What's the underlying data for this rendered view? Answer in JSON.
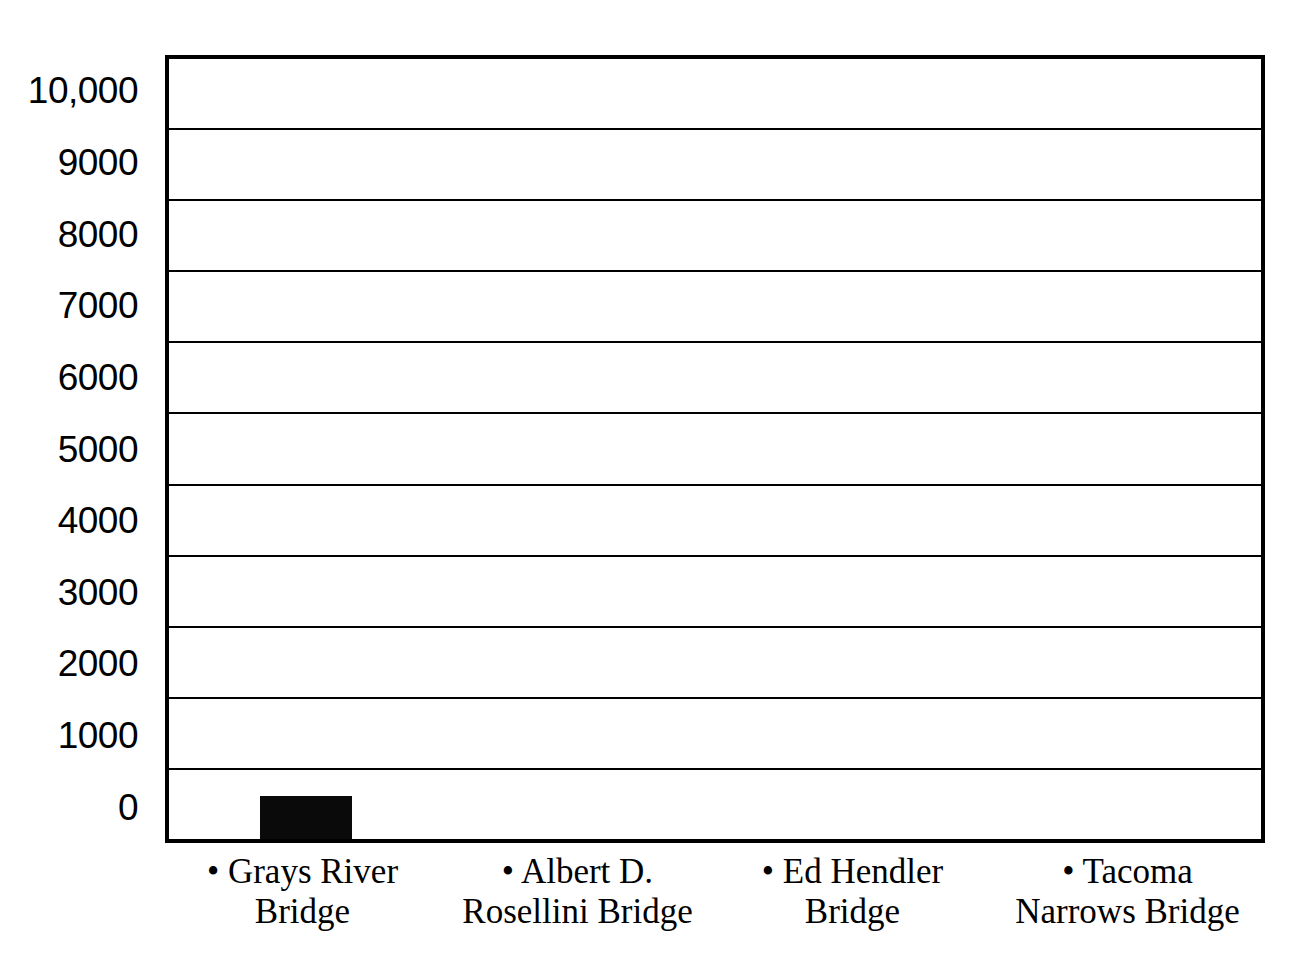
{
  "chart_data": {
    "type": "bar",
    "title": "",
    "subtitle": "",
    "xlabel": "",
    "ylabel": "",
    "categories": [
      "Grays River Bridge",
      "Albert D. Rosellini Bridge",
      "Ed Hendler Bridge",
      "Tacoma Narrows Bridge"
    ],
    "category_lines": [
      [
        "• Grays River",
        "Bridge"
      ],
      [
        "• Albert D.",
        "Rosellini Bridge"
      ],
      [
        "• Ed Hendler",
        "Bridge"
      ],
      [
        "• Tacoma",
        "Narrows Bridge"
      ]
    ],
    "values": [
      600,
      0,
      0,
      0
    ],
    "ylim": [
      0,
      11000
    ],
    "y_band_count": 11,
    "y_tick_labels": [
      "10,000",
      "9000",
      "8000",
      "7000",
      "6000",
      "5000",
      "4000",
      "3000",
      "2000",
      "1000",
      "0"
    ],
    "y_tick_values": [
      10000,
      9000,
      8000,
      7000,
      6000,
      5000,
      4000,
      3000,
      2000,
      1000,
      0
    ],
    "grid": true,
    "grid_orientation": "horizontal",
    "legend": false,
    "legend_position": "none",
    "bar_color": "#0a0a0a",
    "grid_color": "#000000",
    "border_color": "#000000",
    "background_color": "#ffffff",
    "text_color": "#000000"
  },
  "axis": {
    "y_labels": [
      {
        "text": "10,000"
      },
      {
        "text": "9000"
      },
      {
        "text": "8000"
      },
      {
        "text": "7000"
      },
      {
        "text": "6000"
      },
      {
        "text": "5000"
      },
      {
        "text": "4000"
      },
      {
        "text": "3000"
      },
      {
        "text": "2000"
      },
      {
        "text": "1000"
      },
      {
        "text": "0"
      }
    ],
    "x_categories": [
      {
        "line1": "• Grays River",
        "line2": "Bridge"
      },
      {
        "line1": "• Albert D.",
        "line2": "Rosellini Bridge"
      },
      {
        "line1": "• Ed Hendler",
        "line2": "Bridge"
      },
      {
        "line1": "• Tacoma",
        "line2": "Narrows Bridge"
      }
    ]
  }
}
